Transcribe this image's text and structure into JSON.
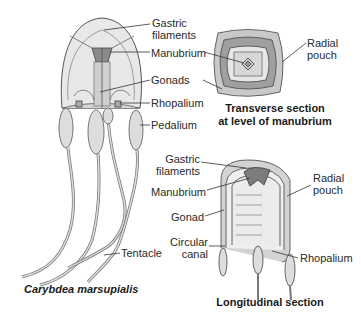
{
  "figure": {
    "species_caption": "Carybdea marsupialis",
    "main_labels": {
      "gastric_filaments": "Gastric filaments",
      "gastric_line1": "Gastric",
      "gastric_line2": "filaments",
      "manubrium": "Manubrium",
      "gonads": "Gonads",
      "rhopalium": "Rhopalium",
      "pedalium": "Pedalium",
      "tentacle": "Tentacle"
    },
    "transverse_section": {
      "caption_line1": "Transverse section",
      "caption_line2": "at level of manubrium",
      "radial_pouch_line1": "Radial",
      "radial_pouch_line2": "pouch"
    },
    "longitudinal_section": {
      "caption": "Longitudinal section",
      "gastric_line1": "Gastric",
      "gastric_line2": "filaments",
      "manubrium": "Manubrium",
      "gonad": "Gonad",
      "circular_line1": "Circular",
      "circular_line2": "canal",
      "radial_pouch_line1": "Radial",
      "radial_pouch_line2": "pouch",
      "rhopalium": "Rhopalium"
    }
  }
}
